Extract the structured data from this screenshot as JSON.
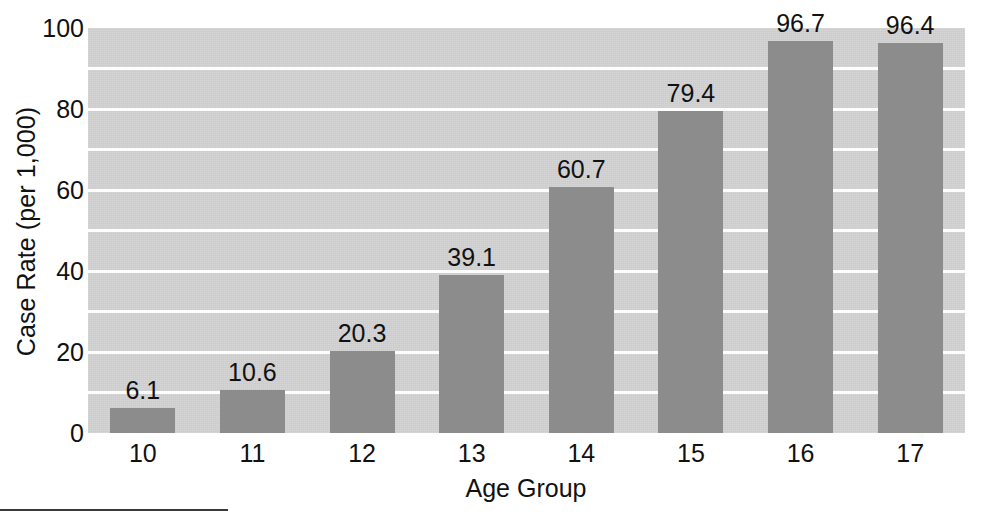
{
  "chart_data": {
    "type": "bar",
    "title": "",
    "subtitle": "",
    "xlabel": "Age Group",
    "ylabel": "Case Rate (per 1,000)",
    "categories": [
      "10",
      "11",
      "12",
      "13",
      "14",
      "15",
      "16",
      "17"
    ],
    "values": [
      6.1,
      10.6,
      20.3,
      39.1,
      60.7,
      79.4,
      96.7,
      96.4
    ],
    "value_labels": [
      "6.1",
      "10.6",
      "20.3",
      "39.1",
      "60.7",
      "79.4",
      "96.7",
      "96.4"
    ],
    "ylim": [
      0,
      100
    ],
    "y_ticks": [
      0,
      20,
      40,
      60,
      80,
      100
    ],
    "y_tick_labels": [
      "0",
      "20",
      "40",
      "60",
      "80",
      "100"
    ],
    "gridlines": [
      10,
      20,
      30,
      40,
      50,
      60,
      70,
      80,
      90
    ],
    "grid": true,
    "legend": null,
    "legend_position": "none",
    "colors": {
      "bar_fill": "#8c8c8c",
      "plot_background": "#d3d3d3",
      "gridline": "#fdfdfd",
      "text": "#111111",
      "page_background": "#ffffff",
      "rule": "#3a3a3a"
    }
  },
  "axes": {
    "y_title": "Case Rate (per 1,000)",
    "x_title": "Age Group"
  },
  "artifacts": {
    "bottom_rule": "horizontal-rule"
  }
}
